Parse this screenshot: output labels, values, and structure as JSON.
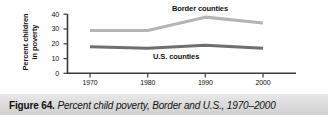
{
  "caption": {
    "number": "Figure 64.",
    "title": "Percent child poverty, Border and U.S., 1970–2000"
  },
  "chart_data": {
    "type": "line",
    "title": "",
    "xlabel": "",
    "ylabel": "Percent children in poverty",
    "ylabel_line1": "Percent children",
    "ylabel_line2": "in poverty",
    "x": [
      1970,
      1980,
      1990,
      2000
    ],
    "categories": [
      "1970",
      "1980",
      "1990",
      "2000"
    ],
    "xticklabels": [
      "1970",
      "1980",
      "1990",
      "2000"
    ],
    "yticklabels": [
      "0",
      "10",
      "20",
      "30",
      "40"
    ],
    "yticks": [
      0,
      10,
      20,
      30,
      40
    ],
    "ylim": [
      0,
      40
    ],
    "xlim": [
      1966,
      2006
    ],
    "grid": false,
    "legend": "inline-annotations",
    "series": [
      {
        "name": "Border counties",
        "label": "Border counties",
        "color": "#b5b5b5",
        "values": [
          29,
          29,
          38,
          34
        ]
      },
      {
        "name": "U.S. counties",
        "label": "U.S. counties",
        "color": "#6f6f6f",
        "values": [
          18,
          17,
          19,
          17
        ]
      }
    ],
    "annotations": [
      {
        "text": "Border counties",
        "x": 1988,
        "y": 42
      },
      {
        "text": "U.S. counties",
        "x": 1984,
        "y": 12
      }
    ],
    "axis_color": "#3a3a3a"
  }
}
